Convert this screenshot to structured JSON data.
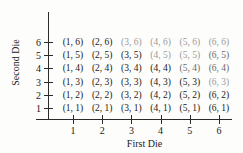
{
  "figure": {
    "x_axis": {
      "title": "First Die",
      "ticks": [
        "1",
        "2",
        "3",
        "4",
        "5",
        "6"
      ]
    },
    "y_axis": {
      "title": "Second Die",
      "ticks": [
        "6",
        "5",
        "4",
        "3",
        "2",
        "1"
      ]
    }
  },
  "chart_data": {
    "type": "scatter",
    "title": "",
    "xlabel": "First Die",
    "ylabel": "Second Die",
    "xlim": [
      0,
      7
    ],
    "ylim": [
      0,
      7
    ],
    "grid": false,
    "legend": null,
    "x_ticks": [
      1,
      2,
      3,
      4,
      5,
      6
    ],
    "y_ticks": [
      1,
      2,
      3,
      4,
      5,
      6
    ],
    "points": [
      {
        "x": 1,
        "y": 6,
        "label": "(1, 6)",
        "shade": "dark"
      },
      {
        "x": 2,
        "y": 6,
        "label": "(2, 6)",
        "shade": "dark"
      },
      {
        "x": 3,
        "y": 6,
        "label": "(3, 6)",
        "shade": "faded"
      },
      {
        "x": 4,
        "y": 6,
        "label": "(4, 6)",
        "shade": "faded"
      },
      {
        "x": 5,
        "y": 6,
        "label": "(5, 6)",
        "shade": "faded"
      },
      {
        "x": 6,
        "y": 6,
        "label": "(6, 6)",
        "shade": "faded"
      },
      {
        "x": 1,
        "y": 5,
        "label": "(1, 5)",
        "shade": "dark"
      },
      {
        "x": 2,
        "y": 5,
        "label": "(2, 5)",
        "shade": "dark"
      },
      {
        "x": 3,
        "y": 5,
        "label": "(3, 5)",
        "shade": "dark"
      },
      {
        "x": 4,
        "y": 5,
        "label": "(4, 5)",
        "shade": "faded"
      },
      {
        "x": 5,
        "y": 5,
        "label": "(5, 5)",
        "shade": "faded"
      },
      {
        "x": 6,
        "y": 5,
        "label": "(6, 5)",
        "shade": "semi"
      },
      {
        "x": 1,
        "y": 4,
        "label": "(1, 4)",
        "shade": "dark"
      },
      {
        "x": 2,
        "y": 4,
        "label": "(2, 4)",
        "shade": "dark"
      },
      {
        "x": 3,
        "y": 4,
        "label": "(3, 4)",
        "shade": "dark"
      },
      {
        "x": 4,
        "y": 4,
        "label": "(4, 4)",
        "shade": "dark"
      },
      {
        "x": 5,
        "y": 4,
        "label": "(5, 4)",
        "shade": "semi"
      },
      {
        "x": 6,
        "y": 4,
        "label": "(6, 4)",
        "shade": "semi"
      },
      {
        "x": 1,
        "y": 3,
        "label": "(1, 3)",
        "shade": "dark"
      },
      {
        "x": 2,
        "y": 3,
        "label": "(2, 3)",
        "shade": "dark"
      },
      {
        "x": 3,
        "y": 3,
        "label": "(3, 3)",
        "shade": "dark"
      },
      {
        "x": 4,
        "y": 3,
        "label": "(4, 3)",
        "shade": "dark"
      },
      {
        "x": 5,
        "y": 3,
        "label": "(5, 3)",
        "shade": "dark"
      },
      {
        "x": 6,
        "y": 3,
        "label": "(6, 3)",
        "shade": "faded"
      },
      {
        "x": 1,
        "y": 2,
        "label": "(1, 2)",
        "shade": "dark"
      },
      {
        "x": 2,
        "y": 2,
        "label": "(2, 2)",
        "shade": "dark"
      },
      {
        "x": 3,
        "y": 2,
        "label": "(3, 2)",
        "shade": "dark"
      },
      {
        "x": 4,
        "y": 2,
        "label": "(4, 2)",
        "shade": "dark"
      },
      {
        "x": 5,
        "y": 2,
        "label": "(5, 2)",
        "shade": "dark"
      },
      {
        "x": 6,
        "y": 2,
        "label": "(6, 2)",
        "shade": "dark"
      },
      {
        "x": 1,
        "y": 1,
        "label": "(1, 1)",
        "shade": "dark"
      },
      {
        "x": 2,
        "y": 1,
        "label": "(2, 1)",
        "shade": "dark"
      },
      {
        "x": 3,
        "y": 1,
        "label": "(3, 1)",
        "shade": "dark"
      },
      {
        "x": 4,
        "y": 1,
        "label": "(4, 1)",
        "shade": "dark"
      },
      {
        "x": 5,
        "y": 1,
        "label": "(5, 1)",
        "shade": "dark"
      },
      {
        "x": 6,
        "y": 1,
        "label": "(6, 1)",
        "shade": "dark"
      }
    ]
  }
}
